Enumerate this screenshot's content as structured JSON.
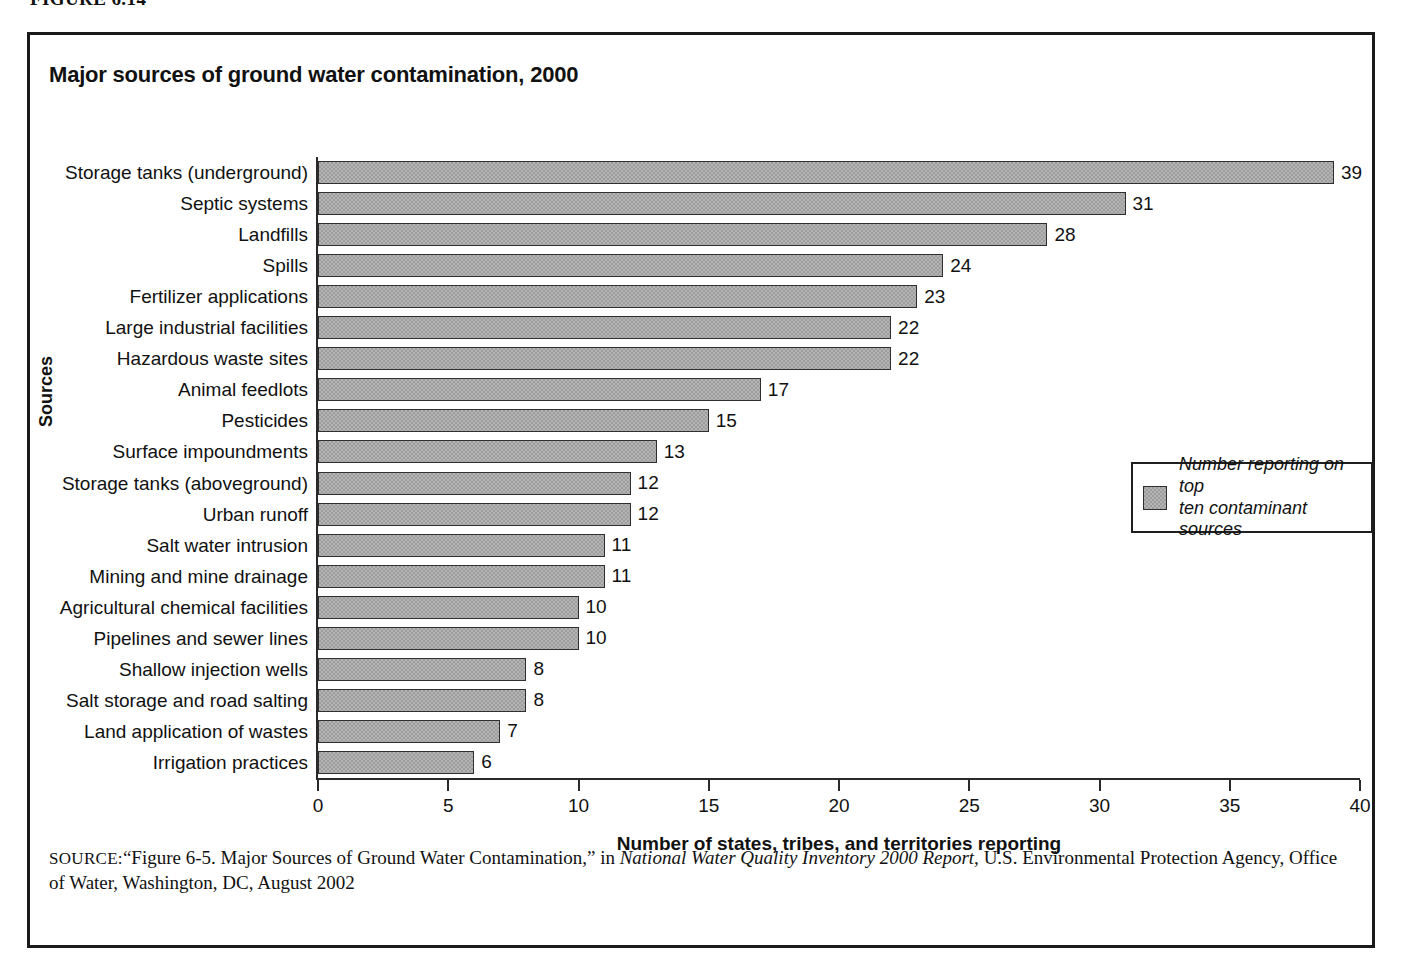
{
  "figure": {
    "caption": "FIGURE 6.14"
  },
  "chart_title": "Major sources of ground water contamination, 2000",
  "legend": {
    "label_line1": "Number reporting on top",
    "label_line2": "ten contaminant sources",
    "swatch_color": "#9d9d9d"
  },
  "source": {
    "keyword": "SOURCE:",
    "text_part1": "“Figure 6-5. Major Sources of Ground Water Contamination,” in ",
    "italic_title": "National Water Quality Inventory 2000 Report,",
    "text_part2": " U.S. Environmental Protection Agency, Office of Water, Washington, DC, August 2002"
  },
  "chart_data": {
    "type": "bar",
    "orientation": "horizontal",
    "title": "Major sources of ground water contamination, 2000",
    "xlabel": "Number of states, tribes, and territories reporting",
    "ylabel": "Sources",
    "xlim": [
      0,
      40
    ],
    "xticks": [
      0,
      5,
      10,
      15,
      20,
      25,
      30,
      35,
      40
    ],
    "grid": false,
    "legend_position": "right-middle",
    "legend_entries": [
      "Number reporting on top ten contaminant sources"
    ],
    "categories": [
      "Storage tanks (underground)",
      "Septic systems",
      "Landfills",
      "Spills",
      "Fertilizer applications",
      "Large industrial facilities",
      "Hazardous waste sites",
      "Animal feedlots",
      "Pesticides",
      "Surface impoundments",
      "Storage tanks (aboveground)",
      "Urban runoff",
      "Salt water intrusion",
      "Mining and mine drainage",
      "Agricultural chemical facilities",
      "Pipelines and sewer lines",
      "Shallow injection wells",
      "Salt storage and road salting",
      "Land application of wastes",
      "Irrigation practices"
    ],
    "values": [
      39,
      31,
      28,
      24,
      23,
      22,
      22,
      17,
      15,
      13,
      12,
      12,
      11,
      11,
      10,
      10,
      8,
      8,
      7,
      6
    ],
    "bar_color": "#9d9d9d"
  }
}
